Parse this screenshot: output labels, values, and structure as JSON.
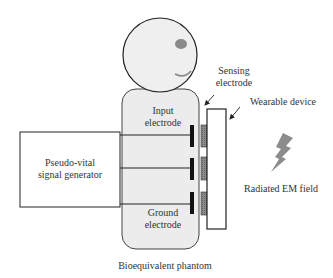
{
  "diagram": {
    "labels": {
      "sensing_electrode_line1": "Sensing",
      "sensing_electrode_line2": "electrode",
      "wearable_device": "Wearable device",
      "input_electrode_line1": "Input",
      "input_electrode_line2": "electrode",
      "generator_line1": "Pseudo-vital",
      "generator_line2": "signal generator",
      "radiated_field": "Radiated EM field",
      "ground_electrode_line1": "Ground",
      "ground_electrode_line2": "electrode",
      "phantom": "Bioequivalent phantom"
    },
    "colors": {
      "phantom_fill": "#ececec",
      "head_fill": "#efefef",
      "eye": "#8a8a8a",
      "electrode": "#111111",
      "sensing_pad": "#7a7a7a",
      "bolt": "#8c8c8c",
      "stroke": "#222222"
    },
    "electrodes": [
      "input",
      "middle",
      "ground"
    ],
    "sensing_pads": 3
  }
}
